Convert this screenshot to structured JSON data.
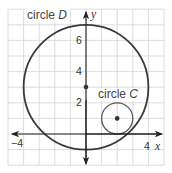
{
  "diagram": {
    "type": "coordinate-plane",
    "grid": {
      "x_range": [
        -5,
        5
      ],
      "y_range": [
        -2,
        8
      ],
      "unit_px": 15.6,
      "origin_px": [
        86,
        134
      ],
      "color": "#d4d4d4"
    },
    "axes": {
      "x_label": "x",
      "y_label": "y",
      "x_ticks": [
        {
          "value": -4,
          "label": "−4"
        },
        {
          "value": 4,
          "label": "4"
        }
      ],
      "y_ticks": [
        {
          "value": 2,
          "label": "2"
        },
        {
          "value": 4,
          "label": "4"
        },
        {
          "value": 6,
          "label": "6"
        }
      ]
    },
    "circles": [
      {
        "name": "circle D",
        "prefix": "circle ",
        "letter": "D",
        "center": [
          0,
          3
        ],
        "radius": 4,
        "center_marked": true
      },
      {
        "name": "circle C",
        "prefix": "circle ",
        "letter": "C",
        "center": [
          2,
          1
        ],
        "radius": 1,
        "center_marked": true
      }
    ]
  }
}
